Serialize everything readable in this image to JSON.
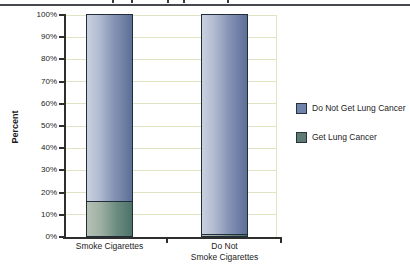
{
  "chart_data": {
    "type": "bar",
    "variant": "stacked-100-percent",
    "categories": [
      "Smoke Cigarettes",
      "Do Not\nSmoke Cigarettes"
    ],
    "series": [
      {
        "name": "Do Not Get Lung Cancer",
        "values": [
          84,
          99
        ]
      },
      {
        "name": "Get Lung Cancer",
        "values": [
          16,
          1
        ]
      }
    ],
    "ylabel": "Percent",
    "ylim": [
      0,
      100
    ],
    "ytick_step": 10,
    "yticks": [
      "0%",
      "10%",
      "20%",
      "30%",
      "40%",
      "50%",
      "60%",
      "70%",
      "80%",
      "90%",
      "100%"
    ],
    "grid": true,
    "legend_position": "right"
  },
  "legend": {
    "items": [
      {
        "label": "Do Not Get Lung Cancer",
        "swatch": "#7083aa"
      },
      {
        "label": "Get Lung Cancer",
        "swatch": "#5d7b71"
      }
    ]
  },
  "colors": {
    "gridline": "#dfe5c2",
    "axis": "#2e2e2e",
    "bar_border": "#212d3a",
    "bar_blue_light": "#c9d0df",
    "bar_blue_dark": "#5d6f98",
    "bar_green_light": "#b5c1b3",
    "bar_green_dark": "#4d7269",
    "top_rule": "#45494d"
  }
}
